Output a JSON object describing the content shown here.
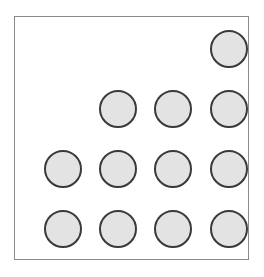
{
  "diagram": {
    "type": "dot-grid",
    "rows": [
      {
        "row": 1,
        "filled_columns": [
          4
        ]
      },
      {
        "row": 2,
        "filled_columns": [
          2,
          3,
          4
        ]
      },
      {
        "row": 3,
        "filled_columns": [
          1,
          2,
          3,
          4
        ]
      },
      {
        "row": 4,
        "filled_columns": [
          1,
          2,
          3,
          4
        ]
      }
    ],
    "total_circles": 12,
    "colors": {
      "fill": "#e3e3e3",
      "stroke": "#3a3a3a",
      "frame": "#8a8a8a"
    }
  }
}
